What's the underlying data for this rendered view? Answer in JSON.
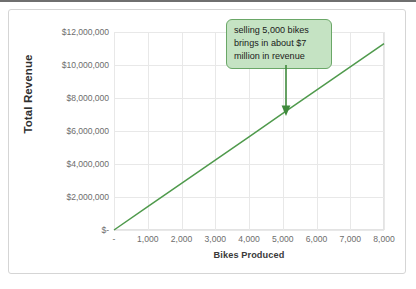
{
  "chart_data": {
    "type": "line",
    "title": "",
    "xlabel": "Bikes Produced",
    "ylabel": "Total Revenue",
    "xlim": [
      0,
      8000
    ],
    "ylim": [
      0,
      12000000
    ],
    "grid": true,
    "legend": "none",
    "series": [
      {
        "name": "Total Revenue",
        "color": "#4f9a4c",
        "x": [
          0,
          1000,
          2000,
          3000,
          4000,
          5000,
          6000,
          7000,
          8000
        ],
        "values": [
          0,
          1412500,
          2825000,
          4237500,
          5650000,
          7062500,
          8475000,
          9887500,
          11300000
        ]
      }
    ],
    "x_tick_labels": [
      "-",
      "1,000",
      "2,000",
      "3,000",
      "4,000",
      "5,000",
      "6,000",
      "7,000",
      "8,000"
    ],
    "x_tick_values": [
      0,
      1000,
      2000,
      3000,
      4000,
      5000,
      6000,
      7000,
      8000
    ],
    "y_tick_labels": [
      "$-",
      "$2,000,000",
      "$4,000,000",
      "$6,000,000",
      "$8,000,000",
      "$10,000,000",
      "$12,000,000"
    ],
    "y_tick_values": [
      0,
      2000000,
      4000000,
      6000000,
      8000000,
      10000000,
      12000000
    ],
    "annotations": [
      {
        "lines": [
          "selling 5,000 bikes",
          "brings in about $7",
          "million in revenue"
        ],
        "point_x": 5000,
        "point_y": 7062500,
        "box_fill": "#c5e3c3",
        "box_border": "#6aa767",
        "arrow_color": "#3f8a3c"
      }
    ]
  },
  "colors": {
    "series_green": "#4f9a4c",
    "grid": "#e8e8e8",
    "axis_text": "#6d6d6d",
    "title_text": "#2f2f2f",
    "card_border": "#d5d5d5",
    "callout_fill": "#c5e3c3",
    "callout_border": "#6aa767"
  }
}
